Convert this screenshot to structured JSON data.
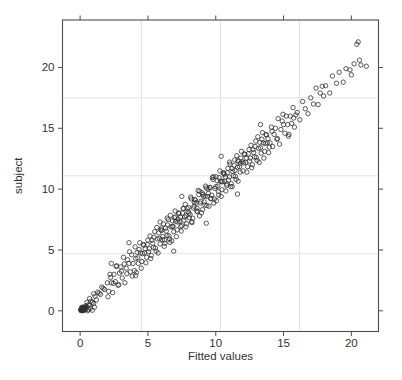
{
  "figure": {
    "background": "#ffffff"
  },
  "chart_data": {
    "type": "scatter",
    "title": "",
    "xlabel": "Fitted values",
    "ylabel": "subject",
    "xlim": [
      -1.3,
      22.0
    ],
    "ylim": [
      -1.7,
      23.9
    ],
    "xticks": [
      0,
      5,
      10,
      15,
      20
    ],
    "yticks": [
      0,
      5,
      10,
      15,
      20
    ],
    "grid": {
      "on": true,
      "x_fractions": [
        0.25,
        0.5,
        0.75
      ],
      "y_fractions": [
        0.25,
        0.5,
        0.75
      ]
    },
    "legend": "none",
    "marker": {
      "shape": "open-circle",
      "radius_px": 2.2
    },
    "colors": {
      "point": "#2f2f2f",
      "grid": "#e4e4e4",
      "border": "#4d4d4d",
      "tick": "#4d4d4d",
      "text": "#333333"
    },
    "points": [
      [
        0.1,
        0.05
      ],
      [
        0.15,
        0.1
      ],
      [
        0.2,
        0.08
      ],
      [
        0.12,
        0.15
      ],
      [
        0.25,
        0.2
      ],
      [
        0.3,
        0.1
      ],
      [
        0.18,
        0.22
      ],
      [
        0.08,
        0.12
      ],
      [
        0.22,
        0.3
      ],
      [
        0.35,
        0.25
      ],
      [
        0.28,
        0.05
      ],
      [
        0.4,
        0.3
      ],
      [
        0.14,
        0.02
      ],
      [
        0.32,
        0.18
      ],
      [
        0.05,
        0.08
      ],
      [
        0.45,
        0.35
      ],
      [
        0.2,
        0.15
      ],
      [
        0.1,
        0.2
      ],
      [
        0.3,
        0.28
      ],
      [
        0.16,
        0.06
      ],
      [
        0.24,
        0.12
      ],
      [
        0.38,
        0.22
      ],
      [
        0.06,
        0.02
      ],
      [
        0.42,
        0.15
      ],
      [
        0.26,
        0.25
      ],
      [
        0.12,
        0.3
      ],
      [
        0.34,
        0.08
      ],
      [
        0.2,
        0.02
      ],
      [
        0.44,
        0.4
      ],
      [
        0.15,
        0.18
      ],
      [
        0.55,
        0.0
      ],
      [
        0.6,
        0.1
      ],
      [
        0.7,
        0.45
      ],
      [
        0.75,
        0.2
      ],
      [
        0.9,
        0.05
      ],
      [
        1.0,
        0.6
      ],
      [
        1.05,
        0.3
      ],
      [
        0.5,
        0.7
      ],
      [
        0.6,
        0.5
      ],
      [
        0.7,
        1.0
      ],
      [
        0.8,
        0.8
      ],
      [
        0.9,
        0.7
      ],
      [
        1.0,
        1.4
      ],
      [
        1.1,
        1.2
      ],
      [
        1.2,
        0.9
      ],
      [
        1.3,
        1.55
      ],
      [
        1.4,
        1.45
      ],
      [
        1.5,
        1.35
      ],
      [
        1.6,
        1.95
      ],
      [
        1.7,
        1.85
      ],
      [
        1.8,
        1.75
      ],
      [
        2.0,
        2.3
      ],
      [
        2.1,
        1.6
      ],
      [
        2.2,
        3.0
      ],
      [
        2.3,
        2.3
      ],
      [
        2.4,
        1.5
      ],
      [
        2.5,
        3.0
      ],
      [
        2.6,
        2.4
      ],
      [
        2.7,
        3.7
      ],
      [
        2.8,
        2.1
      ],
      [
        2.9,
        3.1
      ],
      [
        3.0,
        3.6
      ],
      [
        3.1,
        2.7
      ],
      [
        3.2,
        4.4
      ],
      [
        3.3,
        2.3
      ],
      [
        3.4,
        3.5
      ],
      [
        3.5,
        4.2
      ],
      [
        3.6,
        3.9
      ],
      [
        3.7,
        3.2
      ],
      [
        3.8,
        4.6
      ],
      [
        3.9,
        3.9
      ],
      [
        2.05,
        1.15
      ],
      [
        2.25,
        2.75
      ],
      [
        2.45,
        2.25
      ],
      [
        2.65,
        3.65
      ],
      [
        2.85,
        2.15
      ],
      [
        3.05,
        3.25
      ],
      [
        3.25,
        3.85
      ],
      [
        3.45,
        3.05
      ],
      [
        3.65,
        4.85
      ],
      [
        3.85,
        2.85
      ],
      [
        4.0,
        3.3
      ],
      [
        4.1,
        4.3
      ],
      [
        4.2,
        4.8
      ],
      [
        4.3,
        3.9
      ],
      [
        4.4,
        5.6
      ],
      [
        4.5,
        3.5
      ],
      [
        4.6,
        4.7
      ],
      [
        4.7,
        5.4
      ],
      [
        4.8,
        5.1
      ],
      [
        4.9,
        4.4
      ],
      [
        5.0,
        5.8
      ],
      [
        5.1,
        5.1
      ],
      [
        5.2,
        4.3
      ],
      [
        5.3,
        5.8
      ],
      [
        5.4,
        5.2
      ],
      [
        5.5,
        6.5
      ],
      [
        5.6,
        4.9
      ],
      [
        5.7,
        5.9
      ],
      [
        5.8,
        6.4
      ],
      [
        5.9,
        5.5
      ],
      [
        4.05,
        5.25
      ],
      [
        4.15,
        3.15
      ],
      [
        4.25,
        4.35
      ],
      [
        4.35,
        5.05
      ],
      [
        4.45,
        4.75
      ],
      [
        4.55,
        4.05
      ],
      [
        4.65,
        5.45
      ],
      [
        4.75,
        4.75
      ],
      [
        4.85,
        3.95
      ],
      [
        4.95,
        5.45
      ],
      [
        5.05,
        4.85
      ],
      [
        5.15,
        6.15
      ],
      [
        5.25,
        4.55
      ],
      [
        5.35,
        5.55
      ],
      [
        5.45,
        6.05
      ],
      [
        5.55,
        5.15
      ],
      [
        5.65,
        6.85
      ],
      [
        5.75,
        4.75
      ],
      [
        5.85,
        5.95
      ],
      [
        5.95,
        6.65
      ],
      [
        6.0,
        6.8
      ],
      [
        6.1,
        6.1
      ],
      [
        6.2,
        5.3
      ],
      [
        6.3,
        6.8
      ],
      [
        6.4,
        6.2
      ],
      [
        6.5,
        7.5
      ],
      [
        6.6,
        5.9
      ],
      [
        6.7,
        6.9
      ],
      [
        6.8,
        7.4
      ],
      [
        6.9,
        6.5
      ],
      [
        7.0,
        8.2
      ],
      [
        7.1,
        6.1
      ],
      [
        7.2,
        7.3
      ],
      [
        7.3,
        8.0
      ],
      [
        7.4,
        7.7
      ],
      [
        7.5,
        7.0
      ],
      [
        7.6,
        8.4
      ],
      [
        7.7,
        7.7
      ],
      [
        7.8,
        6.9
      ],
      [
        7.9,
        8.4
      ],
      [
        6.05,
        5.85
      ],
      [
        6.15,
        7.15
      ],
      [
        6.25,
        5.55
      ],
      [
        6.35,
        6.55
      ],
      [
        6.45,
        7.05
      ],
      [
        6.55,
        6.15
      ],
      [
        6.65,
        7.85
      ],
      [
        6.75,
        5.75
      ],
      [
        6.85,
        6.95
      ],
      [
        6.95,
        7.65
      ],
      [
        7.05,
        7.35
      ],
      [
        7.15,
        6.65
      ],
      [
        7.25,
        8.05
      ],
      [
        7.35,
        7.35
      ],
      [
        7.45,
        6.55
      ],
      [
        7.55,
        8.05
      ],
      [
        7.65,
        7.45
      ],
      [
        7.75,
        8.75
      ],
      [
        7.85,
        7.15
      ],
      [
        7.95,
        8.15
      ],
      [
        6.02,
        6.62
      ],
      [
        6.22,
        5.82
      ],
      [
        6.42,
        7.62
      ],
      [
        6.62,
        5.62
      ],
      [
        6.82,
        6.92
      ],
      [
        7.02,
        7.72
      ],
      [
        7.22,
        7.52
      ],
      [
        7.42,
        6.92
      ],
      [
        7.62,
        8.42
      ],
      [
        7.82,
        7.82
      ],
      [
        8.0,
        8.5
      ],
      [
        8.1,
        7.9
      ],
      [
        8.2,
        9.2
      ],
      [
        8.3,
        7.6
      ],
      [
        8.4,
        8.6
      ],
      [
        8.5,
        9.1
      ],
      [
        8.6,
        8.2
      ],
      [
        8.7,
        9.9
      ],
      [
        8.8,
        7.8
      ],
      [
        8.9,
        9.0
      ],
      [
        9.0,
        9.7
      ],
      [
        9.1,
        9.4
      ],
      [
        9.2,
        8.7
      ],
      [
        9.3,
        10.1
      ],
      [
        9.4,
        9.4
      ],
      [
        9.5,
        8.6
      ],
      [
        9.6,
        10.1
      ],
      [
        9.7,
        9.5
      ],
      [
        9.8,
        10.8
      ],
      [
        9.9,
        9.2
      ],
      [
        8.05,
        7.65
      ],
      [
        8.15,
        9.35
      ],
      [
        8.25,
        7.25
      ],
      [
        8.35,
        8.45
      ],
      [
        8.45,
        9.15
      ],
      [
        8.55,
        8.85
      ],
      [
        8.65,
        8.15
      ],
      [
        8.75,
        9.55
      ],
      [
        8.85,
        8.85
      ],
      [
        8.95,
        8.05
      ],
      [
        9.05,
        9.55
      ],
      [
        9.15,
        8.95
      ],
      [
        9.25,
        10.25
      ],
      [
        9.35,
        8.65
      ],
      [
        9.45,
        9.65
      ],
      [
        9.55,
        10.15
      ],
      [
        9.65,
        9.25
      ],
      [
        9.75,
        10.95
      ],
      [
        9.85,
        8.85
      ],
      [
        9.95,
        10.05
      ],
      [
        8.02,
        8.02
      ],
      [
        8.22,
        7.32
      ],
      [
        8.42,
        8.92
      ],
      [
        8.62,
        8.42
      ],
      [
        8.82,
        9.82
      ],
      [
        9.02,
        8.32
      ],
      [
        9.22,
        9.42
      ],
      [
        9.42,
        10.02
      ],
      [
        9.62,
        9.22
      ],
      [
        9.82,
        11.02
      ],
      [
        10.0,
        10.2
      ],
      [
        10.1,
        10.7
      ],
      [
        10.2,
        9.8
      ],
      [
        10.3,
        11.5
      ],
      [
        10.4,
        9.4
      ],
      [
        10.5,
        10.6
      ],
      [
        10.6,
        11.3
      ],
      [
        10.7,
        11.0
      ],
      [
        10.8,
        10.3
      ],
      [
        10.9,
        11.7
      ],
      [
        11.0,
        11.0
      ],
      [
        11.1,
        10.2
      ],
      [
        11.2,
        11.7
      ],
      [
        11.3,
        11.1
      ],
      [
        11.4,
        12.4
      ],
      [
        11.5,
        10.8
      ],
      [
        11.6,
        11.8
      ],
      [
        11.7,
        12.3
      ],
      [
        11.8,
        11.4
      ],
      [
        11.9,
        13.1
      ],
      [
        10.05,
        9.05
      ],
      [
        10.15,
        10.25
      ],
      [
        10.25,
        10.95
      ],
      [
        10.35,
        10.65
      ],
      [
        10.45,
        9.95
      ],
      [
        10.55,
        11.35
      ],
      [
        10.65,
        10.65
      ],
      [
        10.75,
        9.85
      ],
      [
        10.85,
        11.35
      ],
      [
        10.95,
        10.75
      ],
      [
        11.05,
        12.05
      ],
      [
        11.15,
        10.45
      ],
      [
        11.25,
        11.45
      ],
      [
        11.35,
        11.95
      ],
      [
        11.45,
        11.05
      ],
      [
        11.55,
        12.75
      ],
      [
        11.65,
        10.65
      ],
      [
        11.75,
        11.85
      ],
      [
        11.85,
        12.55
      ],
      [
        11.95,
        12.25
      ],
      [
        10.02,
        11.02
      ],
      [
        10.22,
        9.52
      ],
      [
        10.42,
        10.62
      ],
      [
        10.62,
        11.22
      ],
      [
        10.82,
        10.42
      ],
      [
        11.02,
        12.22
      ],
      [
        11.22,
        10.22
      ],
      [
        11.42,
        11.52
      ],
      [
        11.62,
        12.32
      ],
      [
        11.82,
        12.12
      ],
      [
        12.0,
        11.5
      ],
      [
        12.1,
        12.9
      ],
      [
        12.2,
        12.2
      ],
      [
        12.3,
        11.4
      ],
      [
        12.4,
        12.9
      ],
      [
        12.5,
        12.3
      ],
      [
        12.6,
        13.6
      ],
      [
        12.7,
        12.0
      ],
      [
        12.8,
        13.0
      ],
      [
        12.9,
        13.5
      ],
      [
        13.0,
        12.6
      ],
      [
        13.1,
        14.3
      ],
      [
        13.2,
        12.2
      ],
      [
        13.3,
        13.4
      ],
      [
        13.4,
        14.1
      ],
      [
        13.5,
        13.8
      ],
      [
        13.6,
        13.1
      ],
      [
        13.7,
        14.5
      ],
      [
        13.8,
        13.8
      ],
      [
        13.9,
        13.0
      ],
      [
        12.05,
        12.15
      ],
      [
        12.15,
        12.85
      ],
      [
        12.25,
        12.55
      ],
      [
        12.35,
        11.85
      ],
      [
        12.45,
        13.25
      ],
      [
        12.55,
        12.55
      ],
      [
        12.65,
        11.75
      ],
      [
        12.75,
        13.25
      ],
      [
        12.85,
        12.65
      ],
      [
        12.95,
        13.95
      ],
      [
        13.05,
        12.35
      ],
      [
        13.15,
        13.35
      ],
      [
        13.25,
        13.85
      ],
      [
        13.35,
        12.95
      ],
      [
        13.45,
        14.65
      ],
      [
        13.55,
        12.55
      ],
      [
        13.65,
        13.75
      ],
      [
        13.75,
        14.45
      ],
      [
        13.85,
        14.15
      ],
      [
        13.95,
        13.45
      ],
      [
        14.0,
        13.8
      ],
      [
        14.1,
        15.1
      ],
      [
        14.2,
        13.5
      ],
      [
        14.3,
        14.5
      ],
      [
        14.4,
        15.0
      ],
      [
        14.5,
        14.1
      ],
      [
        14.6,
        15.8
      ],
      [
        14.7,
        13.7
      ],
      [
        14.8,
        14.9
      ],
      [
        14.9,
        15.6
      ],
      [
        15.0,
        15.3
      ],
      [
        15.1,
        14.6
      ],
      [
        15.2,
        16.0
      ],
      [
        15.3,
        15.3
      ],
      [
        15.4,
        14.5
      ],
      [
        15.5,
        16.0
      ],
      [
        15.6,
        15.4
      ],
      [
        15.7,
        16.7
      ],
      [
        15.8,
        15.1
      ],
      [
        15.9,
        16.1
      ],
      [
        14.15,
        14.75
      ],
      [
        14.55,
        14.15
      ],
      [
        14.95,
        16.15
      ],
      [
        15.35,
        14.35
      ],
      [
        15.75,
        15.85
      ],
      [
        16.0,
        16.3
      ],
      [
        16.2,
        15.7
      ],
      [
        16.4,
        17.2
      ],
      [
        16.6,
        16.6
      ],
      [
        16.8,
        16.2
      ],
      [
        17.0,
        17.5
      ],
      [
        17.2,
        17.0
      ],
      [
        17.4,
        18.3
      ],
      [
        17.55,
        16.95
      ],
      [
        17.7,
        17.9
      ],
      [
        17.85,
        18.45
      ],
      [
        17.95,
        17.65
      ],
      [
        18.1,
        18.5
      ],
      [
        18.4,
        17.9
      ],
      [
        18.6,
        19.3
      ],
      [
        18.9,
        18.7
      ],
      [
        19.1,
        19.6
      ],
      [
        19.4,
        18.8
      ],
      [
        19.6,
        19.9
      ],
      [
        19.9,
        19.8
      ],
      [
        20.0,
        19.4
      ],
      [
        20.2,
        20.3
      ],
      [
        20.4,
        21.9
      ],
      [
        20.5,
        22.1
      ],
      [
        20.6,
        20.6
      ],
      [
        20.7,
        20.2
      ],
      [
        21.1,
        20.1
      ],
      [
        3.6,
        5.6
      ],
      [
        4.1,
        2.9
      ],
      [
        7.5,
        9.4
      ],
      [
        9.3,
        7.2
      ],
      [
        11.6,
        9.6
      ],
      [
        5.9,
        7.3
      ],
      [
        2.3,
        3.9
      ],
      [
        13.3,
        15.3
      ],
      [
        6.9,
        4.9
      ],
      [
        10.4,
        12.7
      ]
    ]
  }
}
